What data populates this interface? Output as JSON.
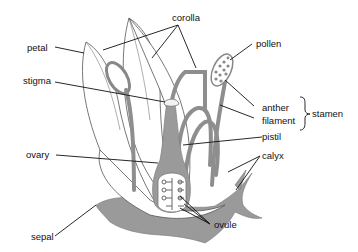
{
  "diagram": {
    "labels": {
      "corolla": "corolla",
      "petal": "petal",
      "pollen": "pollen",
      "stigma": "stigma",
      "anther": "anther",
      "filament": "filament",
      "stamen": "stamen",
      "pistil": "pistil",
      "ovary": "ovary",
      "calyx": "calyx",
      "ovule": "ovule",
      "sepal": "sepal"
    },
    "colors": {
      "tissue": "#9a9a9a",
      "outline": "#555555",
      "background": "#ffffff",
      "text": "#111111"
    }
  }
}
